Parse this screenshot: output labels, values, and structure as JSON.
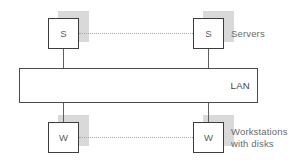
{
  "diagram": {
    "type": "network-topology",
    "colors": {
      "background": "#ffffff",
      "node_border": "#3c3c3c",
      "node_fill": "#ffffff",
      "node_shadow": "#d9d9d9",
      "lan_border": "#4a4a4a",
      "connector": "#606060",
      "dotted_connector": "#a8a8a8",
      "caption_text": "#6a6a6a",
      "node_text": "#5d5d5d",
      "lan_text": "#3f3f3f"
    },
    "nodes": [
      {
        "id": "server-left",
        "label": "S",
        "role": "server"
      },
      {
        "id": "server-right",
        "label": "S",
        "role": "server"
      },
      {
        "id": "workstation-left",
        "label": "W",
        "role": "workstation"
      },
      {
        "id": "workstation-right",
        "label": "W",
        "role": "workstation"
      }
    ],
    "bus": {
      "label": "LAN",
      "label_align": "right"
    },
    "captions": {
      "servers": "Servers",
      "workstations": "Workstations\nwith disks"
    },
    "links": [
      {
        "id": "server-peer-link",
        "style": "dotted",
        "from": "server-left",
        "to": "server-right"
      },
      {
        "id": "workstation-peer-link",
        "style": "dotted",
        "from": "workstation-left",
        "to": "workstation-right"
      },
      {
        "id": "server-left-bus",
        "style": "solid",
        "from": "server-left",
        "to": "lan-bar"
      },
      {
        "id": "server-right-bus",
        "style": "solid",
        "from": "server-right",
        "to": "lan-bar"
      },
      {
        "id": "workstation-left-bus",
        "style": "solid",
        "from": "workstation-left",
        "to": "lan-bar"
      },
      {
        "id": "workstation-right-bus",
        "style": "solid",
        "from": "workstation-right",
        "to": "lan-bar"
      }
    ]
  }
}
